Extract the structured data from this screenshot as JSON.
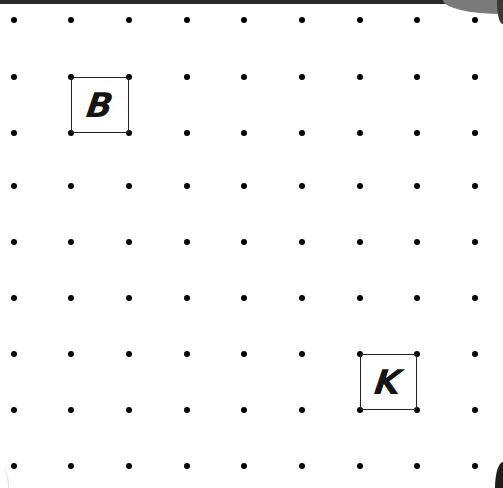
{
  "diagram": {
    "type": "dot-grid",
    "rows": 9,
    "cols": 9,
    "col_positions": [
      14,
      71,
      129,
      187,
      244,
      302,
      360,
      417,
      475
    ],
    "row_positions": [
      20,
      77,
      133,
      186,
      242,
      298,
      354,
      410,
      466
    ],
    "dot_color": "#000000",
    "labeled_squares": [
      {
        "label": "B",
        "from_col": 1,
        "from_row": 1,
        "to_col": 2,
        "to_row": 2
      },
      {
        "label": "K",
        "from_col": 6,
        "from_row": 6,
        "to_col": 7,
        "to_row": 7
      }
    ]
  }
}
